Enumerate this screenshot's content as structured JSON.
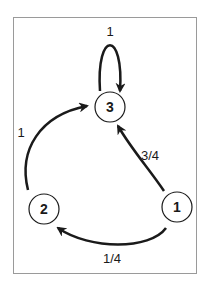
{
  "diagram": {
    "type": "markov-chain",
    "nodes": [
      {
        "id": "1",
        "label": "1"
      },
      {
        "id": "2",
        "label": "2"
      },
      {
        "id": "3",
        "label": "3"
      }
    ],
    "edges": [
      {
        "from": "3",
        "to": "3",
        "label": "1"
      },
      {
        "from": "2",
        "to": "3",
        "label": "1"
      },
      {
        "from": "1",
        "to": "3",
        "label": "3/4"
      },
      {
        "from": "1",
        "to": "2",
        "label": "1/4"
      }
    ],
    "colors": {
      "stroke": "#1a1a1a",
      "frame": "#9a9a9a",
      "background": "#ffffff"
    }
  }
}
